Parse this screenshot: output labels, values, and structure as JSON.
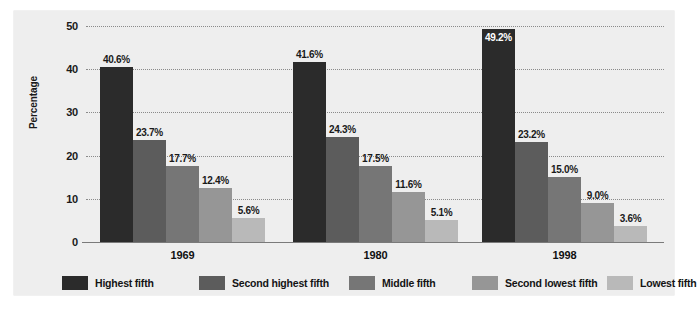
{
  "chart_data": {
    "type": "bar",
    "title": "",
    "subtitle": "",
    "xlabel": "",
    "ylabel": "Percentage",
    "ylim": [
      0,
      50
    ],
    "yticks": [
      0,
      10,
      20,
      30,
      40,
      50
    ],
    "ytick_labels": [
      "0",
      "10",
      "20",
      "30",
      "40",
      "50"
    ],
    "grid": true,
    "grid_style": "dotted-horizontal",
    "legend_position": "bottom",
    "categories": [
      "1969",
      "1980",
      "1998"
    ],
    "series": [
      {
        "name": "Highest fifth",
        "color": "#2b2b2b",
        "values": [
          40.6,
          41.6,
          49.2
        ],
        "labels": [
          "40.6%",
          "41.6%",
          "49.2%"
        ],
        "label_placement": [
          "above",
          "above",
          "inside"
        ]
      },
      {
        "name": "Second highest fifth",
        "color": "#5c5c5c",
        "values": [
          23.7,
          24.3,
          23.2
        ],
        "labels": [
          "23.7%",
          "24.3%",
          "23.2%"
        ],
        "label_placement": [
          "above",
          "above",
          "above"
        ]
      },
      {
        "name": "Middle fifth",
        "color": "#767676",
        "values": [
          17.7,
          17.5,
          15.0
        ],
        "labels": [
          "17.7%",
          "17.5%",
          "15.0%"
        ],
        "label_placement": [
          "above",
          "above",
          "above"
        ]
      },
      {
        "name": "Second lowest fifth",
        "color": "#969696",
        "values": [
          12.4,
          11.6,
          9.0
        ],
        "labels": [
          "12.4%",
          "11.6%",
          "9.0%"
        ],
        "label_placement": [
          "above",
          "above",
          "above"
        ]
      },
      {
        "name": "Lowest fifth",
        "color": "#b9b9b9",
        "values": [
          5.6,
          5.1,
          3.6
        ],
        "labels": [
          "5.6%",
          "5.1%",
          "3.6%"
        ],
        "label_placement": [
          "above",
          "above",
          "above"
        ]
      }
    ]
  },
  "colors": {
    "page_background": "#ffffff",
    "panel_background": "#eeeeee",
    "gridline": "#8a8a8a",
    "axis": "#7a7a7a",
    "text": "#1a1a1a",
    "value_label_inside": "#ffffff"
  },
  "legend": {
    "items": [
      {
        "label": "Highest fifth",
        "color": "#2b2b2b"
      },
      {
        "label": "Second highest fifth",
        "color": "#5c5c5c"
      },
      {
        "label": "Middle fifth",
        "color": "#767676"
      },
      {
        "label": "Second lowest fifth",
        "color": "#969696"
      },
      {
        "label": "Lowest fifth",
        "color": "#b9b9b9"
      }
    ]
  }
}
